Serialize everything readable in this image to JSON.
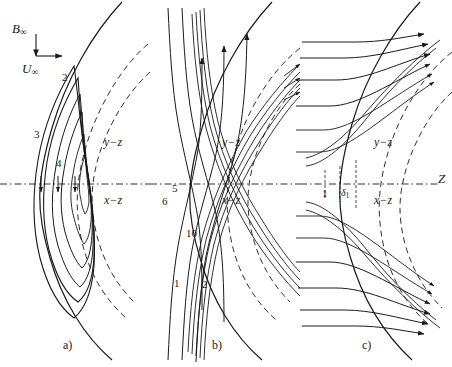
{
  "figure": {
    "axis_indicator": {
      "b_label": "B",
      "b_sub": "∞",
      "u_label": "U",
      "u_sub": "∞"
    },
    "axis_name": "Z",
    "colors": {
      "line": "#1a1a1a",
      "background": "#ffffff"
    }
  },
  "panels": [
    {
      "caption": "a)",
      "planes": {
        "upper": "y−z",
        "lower": "x−z"
      },
      "numbers": [
        {
          "text": "2"
        },
        {
          "text": "3"
        },
        {
          "text": "4"
        }
      ]
    },
    {
      "caption": "b)",
      "planes": {
        "upper": "y−z",
        "lower": "x−z"
      },
      "numbers": [
        {
          "text": "5"
        },
        {
          "text": "6"
        },
        {
          "text": "10"
        },
        {
          "text": "1"
        },
        {
          "text": "2"
        }
      ]
    },
    {
      "caption": "c)",
      "planes": {
        "upper": "y−z",
        "lower": "x−z"
      },
      "numbers": [
        {
          "text": "1"
        },
        {
          "text": "δ",
          "sub": "1"
        }
      ]
    }
  ]
}
